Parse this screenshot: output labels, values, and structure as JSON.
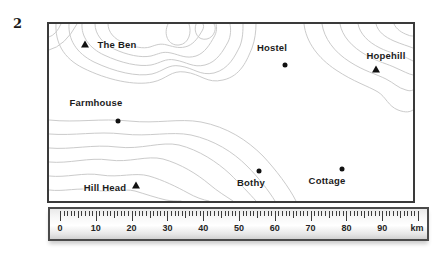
{
  "figure": {
    "question_number": "2"
  },
  "map": {
    "marker_color": "#111111",
    "contour_color": "#cbcbcb",
    "sites": [
      {
        "label": "The Ben",
        "marker": "triangle",
        "mx": 36,
        "my": 20,
        "lx": 68,
        "ly": 20
      },
      {
        "label": "Hostel",
        "marker": "dot",
        "mx": 236,
        "my": 41,
        "lx": 223,
        "ly": 23
      },
      {
        "label": "Hopehill",
        "marker": "triangle",
        "mx": 327,
        "my": 45,
        "lx": 337,
        "ly": 31
      },
      {
        "label": "Farmhouse",
        "marker": "dot",
        "mx": 69,
        "my": 97,
        "lx": 47,
        "ly": 78
      },
      {
        "label": "Hill Head",
        "marker": "triangle",
        "mx": 87,
        "my": 161,
        "lx": 56,
        "ly": 163
      },
      {
        "label": "Bothy",
        "marker": "dot",
        "mx": 210,
        "my": 147,
        "lx": 202,
        "ly": 158
      },
      {
        "label": "Cottage",
        "marker": "dot",
        "mx": 293,
        "my": 145,
        "lx": 278,
        "ly": 156
      }
    ]
  },
  "ruler": {
    "labels": [
      "0",
      "10",
      "20",
      "30",
      "40",
      "50",
      "60",
      "70",
      "80",
      "90"
    ],
    "unit": "km",
    "min_km": 0,
    "max_km": 100,
    "minor_step_km": 1,
    "major_step_km": 10
  }
}
